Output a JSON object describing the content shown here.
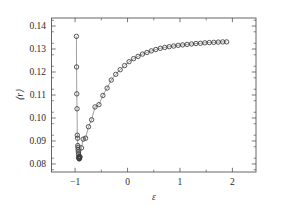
{
  "chart_data": {
    "type": "scatter",
    "title": "",
    "xlabel": "ε",
    "ylabel": "⟨r⟩",
    "xlim": [
      -1.45,
      2.45
    ],
    "ylim": [
      0.0765,
      0.1435
    ],
    "xticks": [
      -1,
      0,
      1,
      2
    ],
    "xtick_labels": [
      "−1",
      "0",
      "1",
      "2"
    ],
    "yticks": [
      0.08,
      0.09,
      0.1,
      0.11,
      0.12,
      0.13,
      0.14
    ],
    "ytick_labels": [
      "0.08",
      "0.09",
      "0.10",
      "0.11",
      "0.12",
      "0.13",
      "0.14"
    ],
    "xminor_step": 0.5,
    "yminor_step": 0.005,
    "grid": false,
    "legend": null,
    "marker": "open-circle",
    "marker_size": 4.4,
    "line_style": "solid-thin",
    "series": [
      {
        "name": "upper-branch",
        "comment": "near-vertical descending branch at eps approx -0.97",
        "x": [
          -0.975,
          -0.972,
          -0.968,
          -0.963,
          -0.958,
          -0.952,
          -0.948,
          -0.945,
          -0.942,
          -0.938,
          -0.934,
          -0.93
        ],
        "y": [
          0.1355,
          0.1222,
          0.1105,
          0.104,
          0.0925,
          0.0912,
          0.088,
          0.0872,
          0.0862,
          0.0852,
          0.0842,
          0.0832
        ]
      },
      {
        "name": "lower-cluster",
        "comment": "dense overlapping circles at the minimum",
        "x": [
          -0.93,
          -0.926,
          -0.922,
          -0.918,
          -0.914,
          -0.91
        ],
        "y": [
          0.0828,
          0.0824,
          0.0822,
          0.0823,
          0.0826,
          0.0831
        ]
      },
      {
        "name": "rising-branch",
        "comment": "saturating rise toward 0.133",
        "x": [
          -0.91,
          -0.878,
          -0.845,
          -0.8,
          -0.745,
          -0.685,
          -0.62,
          -0.545,
          -0.47,
          -0.39,
          -0.31,
          -0.225,
          -0.14,
          -0.055,
          0.03,
          0.115,
          0.2,
          0.285,
          0.37,
          0.455,
          0.54,
          0.625,
          0.71,
          0.795,
          0.88,
          0.965,
          1.05,
          1.135,
          1.22,
          1.305,
          1.39,
          1.475,
          1.56,
          1.645,
          1.73,
          1.815,
          1.89
        ],
        "y": [
          0.0831,
          0.087,
          0.0908,
          0.0912,
          0.0962,
          0.0992,
          0.1048,
          0.1058,
          0.1098,
          0.113,
          0.1165,
          0.119,
          0.121,
          0.1228,
          0.1245,
          0.1258,
          0.1268,
          0.1278,
          0.1285,
          0.1292,
          0.1298,
          0.1303,
          0.1307,
          0.131,
          0.1313,
          0.1316,
          0.1318,
          0.132,
          0.1322,
          0.1324,
          0.1325,
          0.1327,
          0.1328,
          0.1329,
          0.133,
          0.1331,
          0.1331
        ]
      }
    ]
  }
}
